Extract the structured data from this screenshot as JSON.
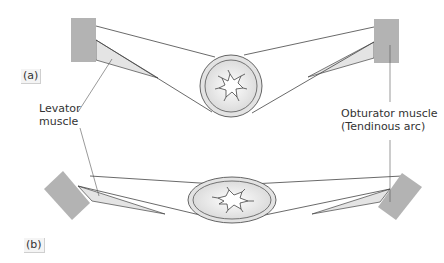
{
  "panels": [
    {
      "tag": "(a)"
    },
    {
      "tag": "(b)"
    }
  ],
  "labels": {
    "levator_line1": "Levator",
    "levator_line2": "muscle",
    "obturator_line1": "Obturator muscle",
    "obturator_line2": "(Tendinous arc)"
  },
  "colors": {
    "muscle_block": "#b3b3b3",
    "sling_fill": "#e6e6e6",
    "ring_fill": "#e3e3e3",
    "outline": "#444444",
    "text": "#333333"
  }
}
